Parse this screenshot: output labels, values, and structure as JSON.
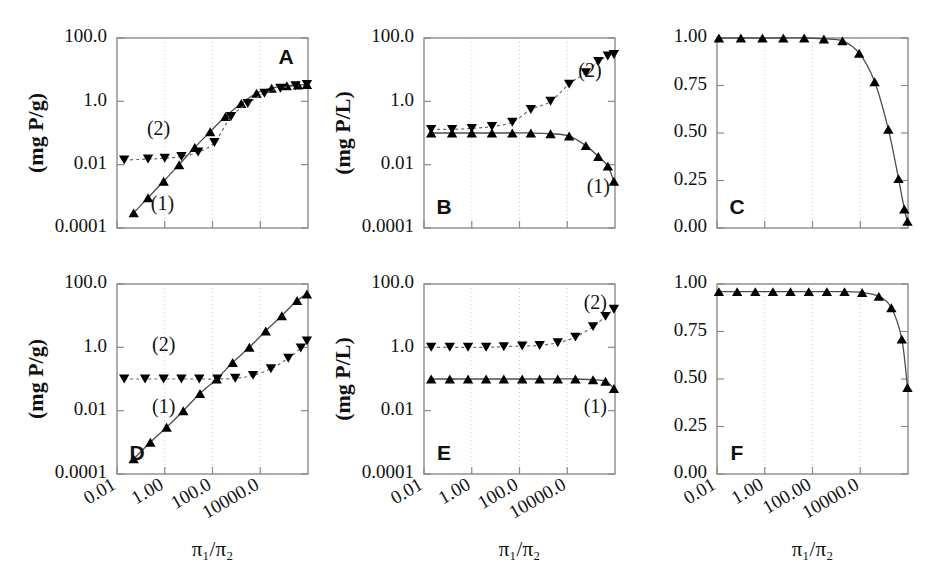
{
  "figure": {
    "width": 932,
    "height": 576,
    "background": "#ffffff",
    "marker_color": "#000000",
    "axis_color": "#8a8a8a",
    "grid_color": "#c9c9c9"
  },
  "axis_titles": {
    "x": "π₁/π₂",
    "y_mass": "(mg  P/g)",
    "y_conc": "(mg  P/L)"
  },
  "series_labels": {
    "one": "(1)",
    "two": "(2)"
  },
  "chart_data": [
    {
      "id": "A",
      "type": "line",
      "title": "A",
      "xlabel": "π₁/π₂",
      "ylabel": "(mg  P/g)",
      "xscale": "log",
      "yscale": "log",
      "xlim": [
        0.01,
        1000000.0
      ],
      "ylim": [
        0.0001,
        100.0
      ],
      "grid": true,
      "xticks": [
        0.01,
        1.0,
        100.0,
        10000.0
      ],
      "xtick_labels": [
        "0.01",
        "1.00",
        "100.0",
        "10000.0"
      ],
      "xtick_labels_visible": false,
      "yticks": [
        0.0001,
        0.01,
        1.0,
        100.0
      ],
      "ytick_labels": [
        "0.0001",
        "0.01",
        "1.0",
        "100.0"
      ],
      "series": [
        {
          "name": "(1)",
          "marker": "triangle-up",
          "line": "solid",
          "label_x": 0.8,
          "label_y": 0.0005,
          "x": [
            0.05,
            0.2,
            0.9,
            4.0,
            18.0,
            80.0,
            350.0,
            1600.0,
            7000.0,
            30000.0,
            130000.0,
            380000.0,
            900000.0
          ],
          "y": [
            0.0003,
            0.0009,
            0.003,
            0.01,
            0.035,
            0.11,
            0.33,
            0.85,
            1.8,
            2.6,
            3.1,
            3.3,
            3.4
          ]
        },
        {
          "name": "(2)",
          "marker": "triangle-down",
          "line": "dashed",
          "label_x": 0.55,
          "label_y": 0.12,
          "x": [
            0.02,
            0.2,
            1.0,
            5.0,
            25.0,
            120.0,
            600.0,
            3000.0,
            15000.0,
            70000.0,
            300000.0,
            900000.0
          ],
          "y": [
            0.014,
            0.015,
            0.016,
            0.018,
            0.025,
            0.05,
            0.33,
            0.85,
            1.8,
            2.6,
            3.1,
            3.4
          ]
        }
      ]
    },
    {
      "id": "B",
      "type": "line",
      "title": "B",
      "xlabel": "π₁/π₂",
      "ylabel": "(mg  P/L)",
      "xscale": "log",
      "yscale": "log",
      "xlim": [
        0.01,
        1000000.0
      ],
      "ylim": [
        0.0001,
        100.0
      ],
      "grid": true,
      "xticks": [
        0.01,
        1.0,
        100.0,
        10000.0
      ],
      "xtick_labels": [
        "0.01",
        "1.00",
        "100.0",
        "10000.0"
      ],
      "xtick_labels_visible": false,
      "yticks": [
        0.0001,
        0.01,
        1.0,
        100.0
      ],
      "ytick_labels": [
        "0.0001",
        "0.01",
        "1.0",
        "100.0"
      ],
      "series": [
        {
          "name": "(1)",
          "marker": "triangle-up",
          "line": "solid",
          "label_x": 200000.0,
          "label_y": 0.0018,
          "x": [
            0.02,
            0.15,
            1.0,
            7.0,
            50.0,
            300.0,
            2000.0,
            12000.0,
            60000.0,
            200000.0,
            500000.0,
            900000.0
          ],
          "y": [
            0.1,
            0.1,
            0.1,
            0.1,
            0.1,
            0.1,
            0.095,
            0.08,
            0.04,
            0.018,
            0.009,
            0.003
          ]
        },
        {
          "name": "(2)",
          "marker": "triangle-down",
          "line": "dashed",
          "label_x": 90000.0,
          "label_y": 8.0,
          "x": [
            0.02,
            0.15,
            1.0,
            7.0,
            50.0,
            300.0,
            2000.0,
            12000.0,
            60000.0,
            200000.0,
            500000.0,
            900000.0
          ],
          "y": [
            0.13,
            0.13,
            0.14,
            0.16,
            0.22,
            0.55,
            1.0,
            3.5,
            8.0,
            18.0,
            27.0,
            30.0
          ]
        }
      ]
    },
    {
      "id": "C",
      "type": "line",
      "title": "C",
      "xlabel": "π₁/π₂",
      "ylabel": "",
      "xscale": "log",
      "yscale": "linear",
      "xlim": [
        0.01,
        1000000.0
      ],
      "ylim": [
        0.0,
        1.0
      ],
      "grid": true,
      "xticks": [
        0.01,
        1.0,
        100.0,
        10000.0
      ],
      "xtick_labels": [
        "0.01",
        "1.00",
        "100.00",
        "10000.0"
      ],
      "xtick_labels_visible": false,
      "yticks": [
        0.0,
        0.25,
        0.5,
        0.75,
        1.0
      ],
      "ytick_labels": [
        "0.00",
        "0.25",
        "0.50",
        "0.75",
        "1.00"
      ],
      "series": [
        {
          "name": "fraction",
          "marker": "triangle-up",
          "line": "solid",
          "x": [
            0.012,
            0.1,
            0.8,
            6.0,
            45.0,
            300.0,
            1800.0,
            9000.0,
            40000.0,
            150000.0,
            400000.0,
            700000.0,
            950000.0
          ],
          "y": [
            1.0,
            1.0,
            1.0,
            1.0,
            1.0,
            0.995,
            0.985,
            0.92,
            0.77,
            0.52,
            0.26,
            0.1,
            0.035
          ]
        }
      ]
    },
    {
      "id": "D",
      "type": "line",
      "title": "D",
      "xlabel": "π₁/π₂",
      "ylabel": "(mg  P/g)",
      "xscale": "log",
      "yscale": "log",
      "xlim": [
        0.01,
        1000000.0
      ],
      "ylim": [
        0.0001,
        100.0
      ],
      "grid": true,
      "xticks": [
        0.01,
        1.0,
        100.0,
        10000.0
      ],
      "xtick_labels": [
        "0.01",
        "1.00",
        "100.0",
        "10000.0"
      ],
      "xtick_labels_visible": true,
      "yticks": [
        0.0001,
        0.01,
        1.0,
        100.0
      ],
      "ytick_labels": [
        "0.0001",
        "0.01",
        "1.0",
        "100.0"
      ],
      "series": [
        {
          "name": "(1)",
          "marker": "triangle-up",
          "line": "solid",
          "label_x": 0.9,
          "label_y": 0.012,
          "x": [
            0.05,
            0.25,
            1.2,
            6.0,
            30.0,
            150.0,
            700.0,
            3500.0,
            17000.0,
            80000.0,
            350000.0,
            900000.0
          ],
          "y": [
            0.0003,
            0.001,
            0.003,
            0.01,
            0.035,
            0.1,
            0.33,
            1.0,
            3.3,
            10.0,
            30.0,
            48.0
          ]
        },
        {
          "name": "(2)",
          "marker": "triangle-down",
          "line": "dashed",
          "label_x": 0.9,
          "label_y": 1.1,
          "x": [
            0.02,
            0.15,
            0.9,
            5.0,
            28.0,
            160.0,
            900.0,
            5000.0,
            28000.0,
            150000.0,
            500000.0,
            900000.0
          ],
          "y": [
            0.1,
            0.1,
            0.1,
            0.1,
            0.1,
            0.1,
            0.105,
            0.13,
            0.21,
            0.45,
            0.95,
            1.6
          ]
        }
      ]
    },
    {
      "id": "E",
      "type": "line",
      "title": "E",
      "xlabel": "π₁/π₂",
      "ylabel": "(mg  P/L)",
      "xscale": "log",
      "yscale": "log",
      "xlim": [
        0.01,
        1000000.0
      ],
      "ylim": [
        0.0001,
        100.0
      ],
      "grid": true,
      "xticks": [
        0.01,
        1.0,
        100.0,
        10000.0
      ],
      "xtick_labels": [
        "0.01",
        "1.00",
        "100.0",
        "10000.0"
      ],
      "xtick_labels_visible": true,
      "yticks": [
        0.0001,
        0.01,
        1.0,
        100.0
      ],
      "ytick_labels": [
        "0.0001",
        "0.01",
        "1.0",
        "100.0"
      ],
      "series": [
        {
          "name": "(1)",
          "marker": "triangle-up",
          "line": "solid",
          "label_x": 150000.0,
          "label_y": 0.012,
          "x": [
            0.02,
            0.12,
            0.7,
            4.0,
            22.0,
            130.0,
            700.0,
            4000.0,
            22000.0,
            120000.0,
            400000.0,
            900000.0
          ],
          "y": [
            0.1,
            0.1,
            0.1,
            0.1,
            0.1,
            0.1,
            0.1,
            0.1,
            0.1,
            0.095,
            0.085,
            0.05
          ]
        },
        {
          "name": "(2)",
          "marker": "triangle-down",
          "line": "dashed",
          "label_x": 150000.0,
          "label_y": 22.0,
          "x": [
            0.02,
            0.12,
            0.7,
            4.0,
            22.0,
            130.0,
            700.0,
            4000.0,
            22000.0,
            120000.0,
            400000.0,
            900000.0
          ],
          "y": [
            1.0,
            1.0,
            1.0,
            1.0,
            1.05,
            1.1,
            1.15,
            1.4,
            2.1,
            4.5,
            9.5,
            16.0
          ]
        }
      ]
    },
    {
      "id": "F",
      "type": "line",
      "title": "F",
      "xlabel": "π₁/π₂",
      "ylabel": "",
      "xscale": "log",
      "yscale": "linear",
      "xlim": [
        0.01,
        1000000.0
      ],
      "ylim": [
        0.0,
        1.0
      ],
      "grid": true,
      "xticks": [
        0.01,
        1.0,
        100.0,
        10000.0
      ],
      "xtick_labels": [
        "0.01",
        "1.00",
        "100.00",
        "10000.0"
      ],
      "xtick_labels_visible": true,
      "yticks": [
        0.0,
        0.25,
        0.5,
        0.75,
        1.0
      ],
      "ytick_labels": [
        "0.00",
        "0.25",
        "0.50",
        "0.75",
        "1.00"
      ],
      "series": [
        {
          "name": "fraction",
          "marker": "triangle-up",
          "line": "solid",
          "x": [
            0.012,
            0.07,
            0.4,
            2.2,
            12.0,
            70.0,
            400.0,
            2200.0,
            12000.0,
            60000.0,
            200000.0,
            550000.0,
            950000.0
          ],
          "y": [
            0.96,
            0.96,
            0.96,
            0.96,
            0.96,
            0.96,
            0.96,
            0.96,
            0.955,
            0.935,
            0.875,
            0.71,
            0.455
          ]
        }
      ]
    }
  ],
  "panel_geometry": {
    "cols": [
      {
        "panel_left": 117,
        "panel_right": 308
      },
      {
        "panel_left": 424,
        "panel_right": 615
      },
      {
        "panel_left": 717,
        "panel_right": 908
      }
    ],
    "rows": [
      {
        "panel_top": 38,
        "panel_bottom": 228
      },
      {
        "panel_top": 284,
        "panel_bottom": 474
      }
    ]
  }
}
